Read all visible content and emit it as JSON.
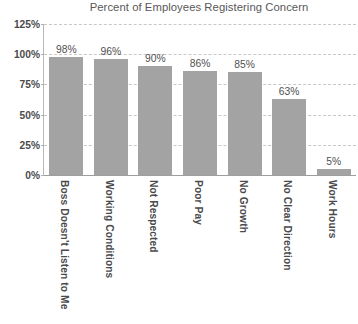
{
  "chart_data": {
    "type": "bar",
    "title": "Percent of Employees Registering Concern",
    "xlabel": "",
    "ylabel": "",
    "ylim": [
      0,
      125
    ],
    "ytick_labels": [
      "0%",
      "25%",
      "50%",
      "75%",
      "100%",
      "125%"
    ],
    "ytick_values": [
      0,
      25,
      50,
      75,
      100,
      125
    ],
    "grid": "horizontal-dashed",
    "legend": "none",
    "orientation": "vertical",
    "bar_color": "#a3a3a3",
    "categories": [
      "Boss Doesn't Listen to Me",
      "Working Conditions",
      "Not Respected",
      "Poor Pay",
      "No Growth",
      "No Clear Direction",
      "Work Hours"
    ],
    "values": [
      98,
      96,
      90,
      86,
      85,
      63,
      5
    ],
    "value_labels": [
      "98%",
      "96%",
      "90%",
      "86%",
      "85%",
      "63%",
      "5%"
    ]
  },
  "colors": {
    "bar": "#a3a3a3",
    "gridline": "#c8c8c8",
    "axis": "#9e9e9e",
    "title_text": "#58585a",
    "tick_text": "#4a4a4c",
    "value_text": "#4f4f51",
    "background": "#ffffff"
  }
}
